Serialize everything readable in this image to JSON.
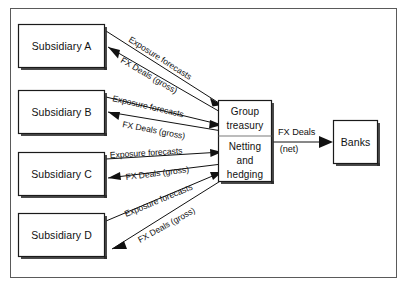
{
  "diagram": {
    "background_color": "#ffffff",
    "frame_color": "#5a5a5a",
    "line_color": "#111111",
    "box_fill": "#ffffff",
    "box_stroke": "#1a1a1a",
    "shadow_color": "#2b2b2b",
    "subsidiaries": [
      {
        "id": "subsidiary-a",
        "label": "Subsidiary A"
      },
      {
        "id": "subsidiary-b",
        "label": "Subsidiary B"
      },
      {
        "id": "subsidiary-c",
        "label": "Subsidiary C"
      },
      {
        "id": "subsidiary-d",
        "label": "Subsidiary D"
      }
    ],
    "treasury": {
      "id": "group-treasury",
      "line1": "Group",
      "line2": "treasury",
      "line3": "Netting",
      "line4": "and",
      "line5": "hedging"
    },
    "banks": {
      "id": "banks",
      "label": "Banks"
    },
    "edge_labels": {
      "exposure_forecasts": "Exposure forecasts",
      "fx_deals_gross": "FX Deals (gross)",
      "fx_deals_net_line1": "FX Deals",
      "fx_deals_net_line2": "(net)"
    },
    "flows": [
      {
        "from": "subsidiary-a",
        "to": "group-treasury",
        "label": "Exposure forecasts",
        "direction": "to-treasury"
      },
      {
        "from": "group-treasury",
        "to": "subsidiary-a",
        "label": "FX Deals (gross)",
        "direction": "to-subsidiary"
      },
      {
        "from": "subsidiary-b",
        "to": "group-treasury",
        "label": "Exposure forecasts",
        "direction": "to-treasury"
      },
      {
        "from": "group-treasury",
        "to": "subsidiary-b",
        "label": "FX Deals (gross)",
        "direction": "to-subsidiary"
      },
      {
        "from": "subsidiary-c",
        "to": "group-treasury",
        "label": "Exposure forecasts",
        "direction": "to-treasury"
      },
      {
        "from": "group-treasury",
        "to": "subsidiary-c",
        "label": "FX Deals (gross)",
        "direction": "to-subsidiary"
      },
      {
        "from": "subsidiary-d",
        "to": "group-treasury",
        "label": "Exposure forecasts",
        "direction": "to-treasury"
      },
      {
        "from": "group-treasury",
        "to": "subsidiary-d",
        "label": "FX Deals (gross)",
        "direction": "to-subsidiary"
      },
      {
        "from": "group-treasury",
        "to": "banks",
        "label": "FX Deals (net)",
        "direction": "to-banks"
      }
    ]
  }
}
